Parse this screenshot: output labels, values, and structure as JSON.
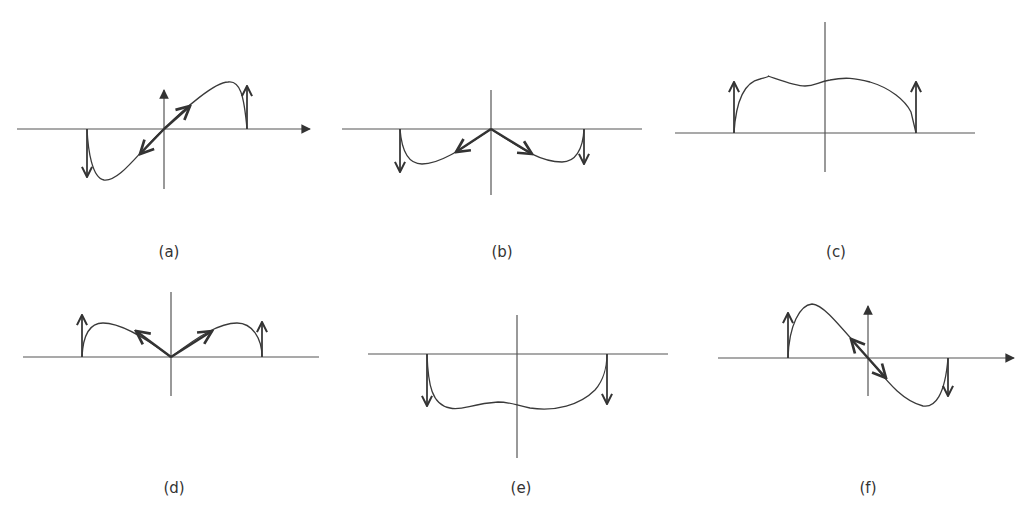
{
  "figure": {
    "panels": [
      {
        "id": "a",
        "label": "(a)",
        "description": "Antisymmetric profile: curve rises from negative trough on left to positive peak on right, with diagonal double arrow through origin, up arrow at right edge, down arrow at left edge; axes with arrowheads"
      },
      {
        "id": "b",
        "label": "(b)",
        "description": "Symmetric negative profile: two lobes below axis, V-shaped arrows pointing down-left and down-right from origin, down arrows at both edges"
      },
      {
        "id": "c",
        "label": "(c)",
        "description": "Positive wavy plateau above axis, up arrows at both edges"
      },
      {
        "id": "d",
        "label": "(d)",
        "description": "Symmetric positive lobes above axis, V-shaped arrows pointing up-left and up-right from origin, up arrows at both edges"
      },
      {
        "id": "e",
        "label": "(e)",
        "description": "Negative wavy trough below axis, down arrows at both edges"
      },
      {
        "id": "f",
        "label": "(f)",
        "description": "Antisymmetric profile: positive peak on left, negative trough on right, diagonal double arrow through origin, up arrow at left edge, down arrow at right edge; axes with arrowheads"
      }
    ]
  },
  "colors": {
    "background": "#ffffff",
    "ink": "#333333",
    "axis": "#555555"
  }
}
